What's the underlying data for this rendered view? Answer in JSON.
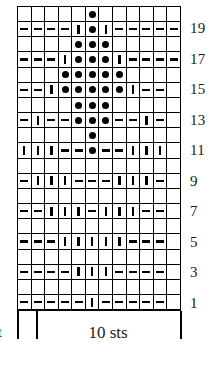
{
  "chart_data": {
    "type": "table",
    "grid": {
      "columns": 12,
      "rows": 20,
      "symbol_legend": {
        "dot": "bobble / popcorn stitch",
        "bar": "knit stitch (vertical bar)",
        "dash": "purl stitch (horizontal dash)",
        "none": "empty cell"
      }
    },
    "row_numbers_visible": [
      "19",
      "17",
      "15",
      "13",
      "11",
      "9",
      "7",
      "5",
      "3",
      "1"
    ],
    "rows": [
      {
        "number": 20,
        "numbered": false,
        "cells": [
          "none",
          "none",
          "none",
          "none",
          "none",
          "dot",
          "none",
          "none",
          "none",
          "none",
          "none",
          "none"
        ]
      },
      {
        "number": 19,
        "numbered": true,
        "label": "19",
        "cells": [
          "dash",
          "dash",
          "dash",
          "dash",
          "bar",
          "dot",
          "bar",
          "dash",
          "dash",
          "dash",
          "dash",
          "dash"
        ]
      },
      {
        "number": 18,
        "numbered": false,
        "cells": [
          "none",
          "none",
          "none",
          "none",
          "dot",
          "dot",
          "dot",
          "none",
          "none",
          "none",
          "none",
          "none"
        ]
      },
      {
        "number": 17,
        "numbered": true,
        "label": "17",
        "cells": [
          "dash",
          "dash",
          "dash",
          "bar",
          "dot",
          "dot",
          "dot",
          "bar",
          "dash",
          "dash",
          "dash",
          "dash"
        ]
      },
      {
        "number": 16,
        "numbered": false,
        "cells": [
          "none",
          "none",
          "none",
          "dot",
          "dot",
          "dot",
          "dot",
          "dot",
          "none",
          "none",
          "none",
          "none"
        ]
      },
      {
        "number": 15,
        "numbered": true,
        "label": "15",
        "cells": [
          "dash",
          "dash",
          "bar",
          "dot",
          "dot",
          "dot",
          "dot",
          "dot",
          "bar",
          "dash",
          "dash",
          "none"
        ]
      },
      {
        "number": 14,
        "numbered": false,
        "cells": [
          "none",
          "none",
          "none",
          "none",
          "dot",
          "dot",
          "dot",
          "none",
          "none",
          "none",
          "none",
          "none"
        ]
      },
      {
        "number": 13,
        "numbered": true,
        "label": "13",
        "cells": [
          "dash",
          "bar",
          "dash",
          "dash",
          "dot",
          "dot",
          "dot",
          "dash",
          "dash",
          "bar",
          "dash",
          "none"
        ]
      },
      {
        "number": 12,
        "numbered": false,
        "cells": [
          "none",
          "none",
          "none",
          "none",
          "none",
          "dot",
          "none",
          "none",
          "none",
          "none",
          "none",
          "none"
        ]
      },
      {
        "number": 11,
        "numbered": true,
        "label": "11",
        "cells": [
          "bar",
          "bar",
          "bar",
          "dash",
          "dash",
          "dot",
          "dash",
          "dash",
          "bar",
          "bar",
          "bar",
          "none"
        ]
      },
      {
        "number": 10,
        "numbered": false,
        "cells": [
          "none",
          "none",
          "none",
          "none",
          "none",
          "none",
          "none",
          "none",
          "none",
          "none",
          "none",
          "none"
        ]
      },
      {
        "number": 9,
        "numbered": true,
        "label": "9",
        "cells": [
          "dash",
          "bar",
          "bar",
          "bar",
          "dash",
          "dash",
          "dash",
          "bar",
          "bar",
          "bar",
          "dash",
          "none"
        ]
      },
      {
        "number": 8,
        "numbered": false,
        "cells": [
          "none",
          "none",
          "none",
          "none",
          "none",
          "none",
          "none",
          "none",
          "none",
          "none",
          "none",
          "none"
        ]
      },
      {
        "number": 7,
        "numbered": true,
        "label": "7",
        "cells": [
          "dash",
          "dash",
          "bar",
          "bar",
          "bar",
          "dash",
          "bar",
          "bar",
          "bar",
          "dash",
          "dash",
          "none"
        ]
      },
      {
        "number": 6,
        "numbered": false,
        "cells": [
          "none",
          "none",
          "none",
          "none",
          "none",
          "none",
          "none",
          "none",
          "none",
          "none",
          "none",
          "none"
        ]
      },
      {
        "number": 5,
        "numbered": true,
        "label": "5",
        "cells": [
          "dash",
          "dash",
          "dash",
          "bar",
          "bar",
          "bar",
          "bar",
          "bar",
          "dash",
          "dash",
          "dash",
          "none"
        ]
      },
      {
        "number": 4,
        "numbered": false,
        "cells": [
          "none",
          "none",
          "none",
          "none",
          "none",
          "none",
          "none",
          "none",
          "none",
          "none",
          "none",
          "none"
        ]
      },
      {
        "number": 3,
        "numbered": true,
        "label": "3",
        "cells": [
          "dash",
          "dash",
          "dash",
          "dash",
          "bar",
          "bar",
          "bar",
          "dash",
          "dash",
          "dash",
          "dash",
          "none"
        ]
      },
      {
        "number": 2,
        "numbered": false,
        "cells": [
          "none",
          "none",
          "none",
          "none",
          "none",
          "none",
          "none",
          "none",
          "none",
          "none",
          "none",
          "none"
        ]
      },
      {
        "number": 1,
        "numbered": true,
        "label": "1",
        "cells": [
          "dash",
          "dash",
          "dash",
          "dash",
          "dash",
          "bar",
          "dash",
          "dash",
          "dash",
          "dash",
          "dash",
          "none"
        ]
      }
    ]
  },
  "caption": {
    "single_stitch_label": "st",
    "repeat_label": "10 sts"
  }
}
